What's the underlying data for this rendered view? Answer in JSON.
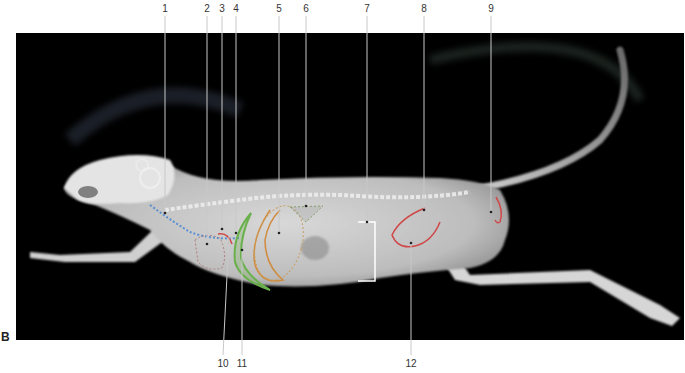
{
  "figure": {
    "panel_letter": "B",
    "top_labels": [
      {
        "id": "1",
        "text": "1",
        "x": 165,
        "target": [
          165,
          213
        ]
      },
      {
        "id": "2",
        "text": "2",
        "x": 207,
        "target": [
          207,
          244
        ]
      },
      {
        "id": "3",
        "text": "3",
        "x": 222,
        "target": [
          222,
          229
        ]
      },
      {
        "id": "4",
        "text": "4",
        "x": 236,
        "target": [
          236,
          233
        ]
      },
      {
        "id": "5",
        "text": "5",
        "x": 279,
        "target": [
          279,
          233
        ]
      },
      {
        "id": "6",
        "text": "6",
        "x": 306,
        "target": [
          306,
          206
        ]
      },
      {
        "id": "7",
        "text": "7",
        "x": 367,
        "target": [
          367,
          222
        ]
      },
      {
        "id": "8",
        "text": "8",
        "x": 424,
        "target": [
          424,
          210
        ]
      },
      {
        "id": "9",
        "text": "9",
        "x": 491,
        "target": [
          491,
          212
        ]
      }
    ],
    "bottom_labels": [
      {
        "id": "10",
        "text": "10",
        "x": 223,
        "target": [
          229,
          236
        ]
      },
      {
        "id": "11",
        "text": "11",
        "x": 242,
        "target": [
          242,
          250
        ]
      },
      {
        "id": "12",
        "text": "12",
        "x": 411,
        "target": [
          411,
          243
        ]
      }
    ],
    "colors": {
      "background": "#000000",
      "leader_line": "#c8c8c8",
      "label_text": "#333333",
      "outline_blue": "#5a8fd0",
      "outline_red": "#d04848",
      "outline_green": "#6ab04c",
      "outline_orange": "#d08a3a",
      "outline_gray_dotted": "#a0a0a0",
      "bracket": "#ffffff"
    }
  }
}
